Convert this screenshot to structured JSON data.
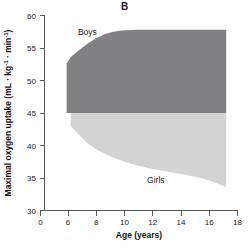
{
  "chart_data": {
    "type": "area",
    "title": "B",
    "xlabel": "Age (years)",
    "ylabel": "Maximal oxygen uptake (mL · kg⁻¹ · min⁻¹)",
    "ylabel_parts": {
      "base": "Maximal oxygen uptake (mL ",
      "mid": "kg",
      "sup1": "-1",
      "mid2": "min",
      "sup2": "-1",
      "tail": ")",
      "dot": "·"
    },
    "xlim": [
      0,
      18
    ],
    "ylim": [
      30,
      60
    ],
    "xticks": [
      0,
      6,
      8,
      10,
      12,
      14,
      16,
      18
    ],
    "xtick_labels": [
      "0",
      "6",
      "8",
      "10",
      "12",
      "14",
      "16",
      "18"
    ],
    "yticks": [
      30,
      35,
      40,
      45,
      50,
      55,
      60
    ],
    "ytick_labels": [
      "30",
      "35",
      "40",
      "45",
      "50",
      "55",
      "60"
    ],
    "axis_break_after_first_xtick": true,
    "grid": false,
    "legend_position": "inline-annotations",
    "series": [
      {
        "name": "Boys",
        "color": "#808184",
        "label": "Boys",
        "label_x": 6.7,
        "label_y": 57.0,
        "x": [
          5.7,
          6.2,
          6.8,
          7.4,
          8.0,
          8.6,
          9.2,
          9.8,
          11.0,
          12.5,
          14.0,
          15.5,
          17.2
        ],
        "upper": [
          52.6,
          53.6,
          54.7,
          55.7,
          56.5,
          57.1,
          57.5,
          57.7,
          57.8,
          57.8,
          57.8,
          57.8,
          57.8
        ],
        "lower": [
          45.0,
          45.0,
          45.0,
          45.0,
          45.0,
          45.0,
          45.0,
          45.0,
          45.0,
          45.0,
          45.0,
          45.0,
          45.0
        ]
      },
      {
        "name": "Girls",
        "color": "#d2d3d5",
        "label": "Girls",
        "label_x": 11.6,
        "label_y": 34.2,
        "x": [
          6.2,
          6.7,
          7.3,
          8.0,
          9.0,
          10.0,
          11.0,
          12.0,
          13.0,
          14.0,
          15.0,
          16.0,
          17.2
        ],
        "upper": [
          45.0,
          45.0,
          45.0,
          45.0,
          45.0,
          45.0,
          45.0,
          45.0,
          45.0,
          45.0,
          45.0,
          45.0,
          45.0
        ],
        "lower": [
          43.0,
          41.8,
          40.5,
          39.4,
          38.3,
          37.5,
          36.9,
          36.4,
          36.0,
          35.6,
          35.2,
          34.6,
          33.6
        ]
      }
    ]
  }
}
